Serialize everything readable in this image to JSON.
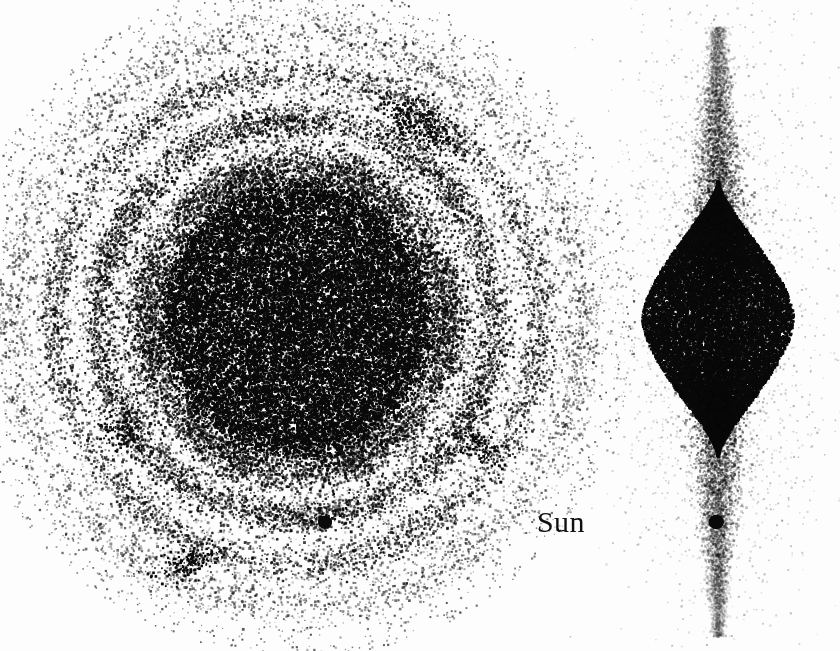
{
  "figure": {
    "background_color": "#fdfdfd",
    "point_color": "#0a0a0a",
    "width": 840,
    "height": 651
  },
  "labels": {
    "sun": "Sun"
  },
  "chart_data": {
    "type": "scatter",
    "xlabel": "",
    "ylabel": "",
    "grid": false,
    "legend_position": "none",
    "annotations": [
      {
        "text": "Sun",
        "x": 565,
        "y": 524,
        "font_size": 30,
        "color": "#101010"
      }
    ],
    "markers": [
      {
        "name": "sun-marker-face-on",
        "panel": "face-on",
        "x": 325,
        "y": 522,
        "radius": 7,
        "color": "#0a0a0a"
      },
      {
        "name": "sun-marker-edge-on",
        "panel": "edge-on",
        "x": 716,
        "y": 522,
        "radius": 7.5,
        "color": "#0a0a0a"
      }
    ],
    "panels": [
      {
        "name": "face-on",
        "view": "face-on projection (x-y plane)",
        "center_x": 296,
        "center_y": 318,
        "extent_x": [
          30,
          562
        ],
        "extent_y": [
          22,
          628
        ],
        "point_size_px": 2.1,
        "total_points": 58000,
        "structure": "concentric rings around a saturated core",
        "core": {
          "radius": 118,
          "edge_softness": 28,
          "points": 27000,
          "squash_y": 1.02
        },
        "rings": [
          {
            "radius": 152,
            "width": 26,
            "points": 9000,
            "opacity": 0.95,
            "label": "ring-1"
          },
          {
            "radius": 198,
            "width": 24,
            "points": 7200,
            "opacity": 0.9,
            "label": "ring-2"
          },
          {
            "radius": 243,
            "width": 23,
            "points": 5200,
            "opacity": 0.8,
            "label": "ring-3"
          },
          {
            "radius": 284,
            "width": 24,
            "points": 3000,
            "opacity": 0.6,
            "label": "ring-4"
          }
        ],
        "halo": {
          "inner_radius": 120,
          "outer_radius": 310,
          "points": 5200,
          "opacity": 0.35
        },
        "clumps": [
          {
            "x": 421,
            "y": 126,
            "sigma_x": 22,
            "sigma_y": 9,
            "points": 330,
            "angle_deg": 28
          },
          {
            "x": 186,
            "y": 563,
            "sigma_x": 16,
            "sigma_y": 8,
            "points": 180,
            "angle_deg": -20
          },
          {
            "x": 481,
            "y": 446,
            "sigma_x": 13,
            "sigma_y": 7,
            "points": 110,
            "angle_deg": 40
          },
          {
            "x": 118,
            "y": 430,
            "sigma_x": 12,
            "sigma_y": 9,
            "points": 95,
            "angle_deg": 0
          }
        ]
      },
      {
        "name": "edge-on",
        "view": "edge-on projection (x-z plane)",
        "center_x": 717,
        "center_y": 318,
        "extent_x": [
          640,
          800
        ],
        "extent_y": [
          26,
          636
        ],
        "point_size_px": 2.1,
        "total_points": 36000,
        "structure": "lens-shaped dense body with narrow vertical spindle tails",
        "lens": {
          "half_width": 76,
          "half_height": 138,
          "points": 24000,
          "exponent": 1.55
        },
        "spindle": {
          "half_width_top": 7,
          "half_width_base": 26,
          "top_y": 26,
          "bottom_y": 636,
          "points": 9500,
          "opacity": 0.75
        },
        "halo": {
          "points": 2500,
          "sigma_x": 52,
          "sigma_y": 150,
          "opacity": 0.3
        }
      }
    ]
  }
}
